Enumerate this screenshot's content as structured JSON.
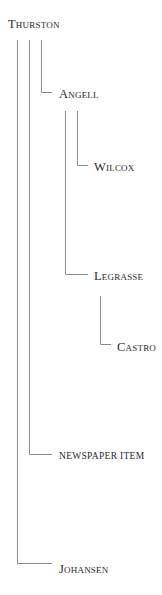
{
  "diagram": {
    "type": "tree",
    "line_color": "#8a8a8a",
    "text_color": "#2a2a2a",
    "nodes": [
      {
        "id": "thurston",
        "label": "Thurston",
        "parent": null
      },
      {
        "id": "angell",
        "label": "Angell",
        "parent": "thurston"
      },
      {
        "id": "wilcox",
        "label": "Wilcox",
        "parent": "angell"
      },
      {
        "id": "legrasse",
        "label": "Legrasse",
        "parent": "angell"
      },
      {
        "id": "castro",
        "label": "Castro",
        "parent": "legrasse"
      },
      {
        "id": "newspaper",
        "label": "NEWSPAPER ITEM",
        "parent": "thurston"
      },
      {
        "id": "johansen",
        "label": "Johansen",
        "parent": "thurston"
      }
    ]
  }
}
